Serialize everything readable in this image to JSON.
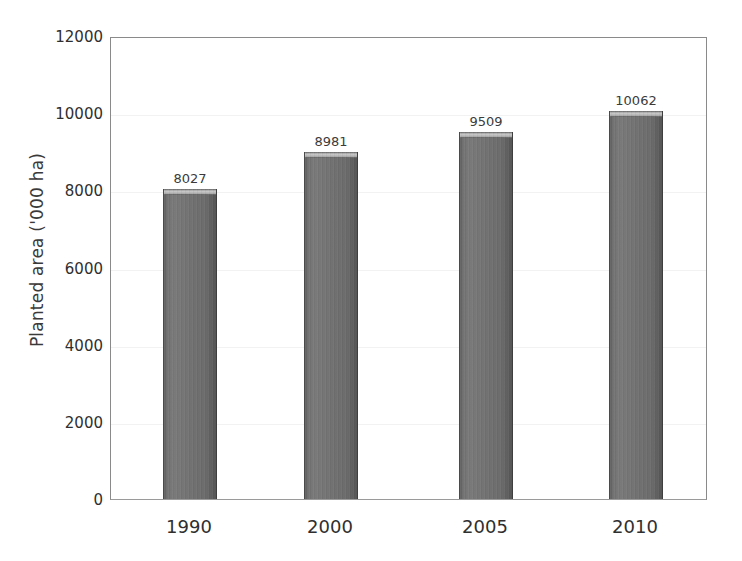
{
  "chart_data": {
    "type": "bar",
    "title": "",
    "xlabel": "",
    "ylabel": "Planted area ('000 ha)",
    "categories": [
      "1990",
      "2000",
      "2005",
      "2010"
    ],
    "values": [
      8027,
      8981,
      9509,
      10062
    ],
    "data_labels": [
      "8027",
      "8981",
      "9509",
      "10062"
    ],
    "ylim": [
      0,
      12000
    ],
    "ytick_labels": [
      "0",
      "2000",
      "4000",
      "6000",
      "8000",
      "10000",
      "12000"
    ],
    "ytick_values": [
      0,
      2000,
      4000,
      6000,
      8000,
      10000,
      12000
    ],
    "grid": true,
    "legend": "none",
    "series": [
      {
        "name": "Planted area",
        "values": [
          8027,
          8981,
          9509,
          10062
        ]
      }
    ],
    "colors": {
      "bar_fill": "#6e6e6e",
      "bar_edge": "#4a4a4a",
      "bar_highlight": "#c9c9c9",
      "axis": "#8a8a8a",
      "gridline": "#f2f2f2",
      "text": "#2f2f2f",
      "background": "#ffffff"
    }
  }
}
